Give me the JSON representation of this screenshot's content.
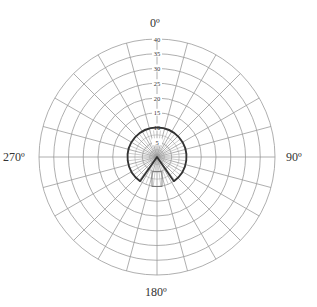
{
  "chart_data": {
    "type": "polar",
    "title": "",
    "angle_labels": [
      {
        "angle": 0,
        "label": "0º"
      },
      {
        "angle": 90,
        "label": "90º"
      },
      {
        "angle": 180,
        "label": "180º"
      },
      {
        "angle": 270,
        "label": "270º"
      }
    ],
    "radial_ticks": [
      5,
      10,
      15,
      20,
      25,
      30,
      35,
      40
    ],
    "rmax": 40,
    "grid": {
      "radial_step_deg": 15,
      "inner_radial_step_deg": 7.5,
      "circle_step": 2.5
    },
    "series": [
      {
        "name": "sector-pattern",
        "kind": "arc-sector",
        "radius": 10,
        "start_angle_deg": 215,
        "end_angle_deg": 145,
        "direction": "clockwise-through-0",
        "closed_to_center": true
      }
    ],
    "annotations": [
      {
        "kind": "rectangle",
        "note": "small rectangle below center",
        "r_from": 5,
        "r_to": 10,
        "angle_center": 180
      }
    ],
    "colors": {
      "grid": "#9a9a9a",
      "series": "#333333",
      "text": "#333333"
    }
  }
}
